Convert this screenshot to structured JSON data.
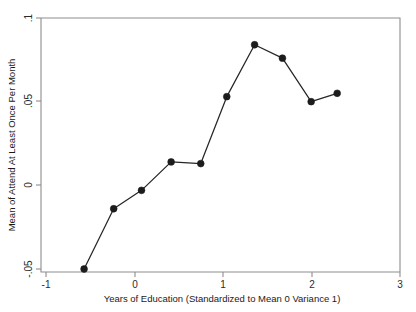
{
  "chart_data": {
    "type": "line",
    "title": "",
    "subtitle": "",
    "xlabel": "Years of Education (Standardized to Mean 0 Variance 1)",
    "ylabel": "Mean of Attend At Least Once Per Month",
    "xlim": [
      -1,
      3
    ],
    "ylim": [
      -0.05,
      0.1
    ],
    "xticks": [
      -1,
      0,
      1,
      2,
      3
    ],
    "xtick_labels": [
      "-1",
      "0",
      "1",
      "2",
      "3"
    ],
    "yticks": [
      -0.05,
      0,
      0.05,
      0.1
    ],
    "ytick_labels": [
      "-.05",
      "0",
      ".05",
      ".1"
    ],
    "grid": false,
    "legend": false,
    "legend_position": "none",
    "marker": "filled-circle",
    "line_color": "#262626",
    "marker_color": "#1c1c1c",
    "frame_color": "#8d8d8d",
    "background_color": "#ffffff",
    "series": [
      {
        "name": "Mean of Attend At Least Once Per Month",
        "x": [
          -0.52,
          -0.19,
          0.12,
          0.45,
          0.78,
          1.07,
          1.38,
          1.69,
          2.01,
          2.3
        ],
        "values": [
          -0.05,
          -0.014,
          -0.003,
          0.014,
          0.013,
          0.053,
          0.084,
          0.076,
          0.05,
          0.055
        ]
      }
    ]
  },
  "axes": {
    "x_title": "Years of Education (Standardized to Mean 0 Variance 1)",
    "y_title": "Mean of Attend At Least Once Per Month",
    "x_tick_0": "-1",
    "x_tick_1": "0",
    "x_tick_2": "1",
    "x_tick_3": "2",
    "x_tick_4": "3",
    "y_tick_0": ".1",
    "y_tick_1": ".05",
    "y_tick_2": "0",
    "y_tick_3": "-.05"
  }
}
